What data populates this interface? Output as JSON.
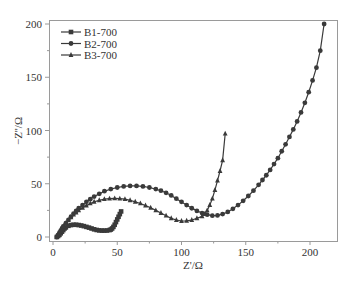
{
  "chart_data": {
    "type": "scatter",
    "title": "",
    "xlabel": "Z'/Ω",
    "ylabel": "−Z''/Ω",
    "xlim": [
      -3,
      221
    ],
    "ylim": [
      -3,
      203
    ],
    "xticks": [
      0,
      50,
      100,
      150,
      200
    ],
    "yticks": [
      0,
      50,
      100,
      150,
      200
    ],
    "grid": false,
    "legend_position": "upper-left",
    "line_color": "#3a3a3a",
    "series": [
      {
        "name": "B1-700",
        "marker": "square",
        "x": [
          3,
          4,
          5,
          6,
          7,
          8,
          9,
          10,
          12,
          14,
          16,
          18,
          20,
          22,
          24,
          26,
          28,
          30,
          32,
          34,
          36,
          38,
          40,
          42,
          44,
          45,
          46,
          47,
          48,
          49,
          50,
          51,
          52,
          53
        ],
        "y": [
          0,
          1,
          2,
          3.5,
          5,
          6.5,
          8,
          9,
          10.5,
          11.2,
          11.5,
          11.5,
          11.2,
          10.8,
          10.2,
          9.5,
          8.8,
          8,
          7.2,
          6.6,
          6.2,
          6,
          6,
          6.1,
          6.5,
          7,
          8,
          9.5,
          11.5,
          14,
          16.5,
          19,
          21.5,
          24
        ]
      },
      {
        "name": "B2-700",
        "marker": "circle",
        "x": [
          3,
          4,
          5,
          6,
          7,
          8,
          10,
          12,
          14,
          16,
          18,
          20,
          23,
          26,
          29,
          32,
          36,
          40,
          45,
          50,
          55,
          60,
          65,
          70,
          75,
          80,
          84,
          88,
          92,
          96,
          100,
          104,
          108,
          112,
          116,
          120,
          124,
          128,
          132,
          136,
          140,
          144,
          148,
          152,
          156,
          160,
          163,
          166,
          169,
          172,
          175,
          178,
          181,
          184,
          187,
          190,
          193,
          196,
          199,
          202,
          205,
          208,
          211
        ],
        "y": [
          0,
          2,
          4,
          6,
          8,
          10,
          13,
          16,
          19,
          22,
          24.5,
          27,
          30,
          33,
          35.5,
          38,
          40.5,
          43,
          45,
          46.5,
          47.5,
          48,
          48,
          47.5,
          46.5,
          45,
          43.5,
          41.5,
          39,
          36,
          33,
          30,
          27,
          24.5,
          22.5,
          21,
          20,
          20.3,
          21.5,
          23.5,
          26.5,
          30,
          34,
          38.5,
          43.5,
          49,
          53.5,
          58,
          63,
          68.5,
          74,
          80.5,
          87,
          94,
          101,
          108.5,
          117,
          126,
          136,
          147,
          159,
          175,
          200
        ]
      },
      {
        "name": "B3-700",
        "marker": "triangle",
        "x": [
          3,
          4,
          5,
          6,
          7,
          8,
          10,
          12,
          14,
          16,
          18,
          20,
          23,
          26,
          29,
          32,
          36,
          40,
          44,
          48,
          52,
          56,
          60,
          64,
          68,
          72,
          76,
          80,
          84,
          88,
          92,
          96,
          100,
          104,
          108,
          112,
          116,
          118,
          120,
          122,
          124,
          126,
          128,
          130,
          132,
          134
        ],
        "y": [
          0,
          2,
          4,
          6,
          8,
          10,
          13,
          16,
          18.5,
          21,
          23,
          25,
          27.5,
          29.5,
          31.5,
          33,
          34.5,
          35.5,
          36,
          36.2,
          36,
          35.5,
          34.5,
          33,
          31.5,
          29.5,
          27.5,
          25,
          22.5,
          20,
          17.5,
          16,
          15,
          15.2,
          16,
          17.5,
          19.5,
          21.5,
          25,
          30,
          36,
          44,
          53,
          62,
          72,
          97
        ]
      }
    ]
  }
}
